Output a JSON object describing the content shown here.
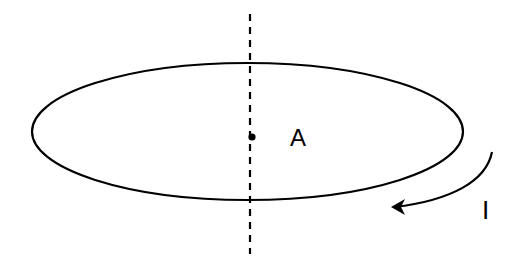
{
  "diagram": {
    "loop": {
      "shape": "ellipse",
      "cx": 247.5,
      "cy": 131.5,
      "rx": 215.5,
      "ry": 68.5,
      "stroke": "#000000"
    },
    "axis": {
      "style": "dashed",
      "x": 250,
      "y1": 14,
      "y2": 254
    },
    "point": {
      "label": "A",
      "x": 252,
      "y": 137
    },
    "current": {
      "label": "I",
      "direction": "clockwise-front (arrow pointing left along lower front)"
    }
  }
}
